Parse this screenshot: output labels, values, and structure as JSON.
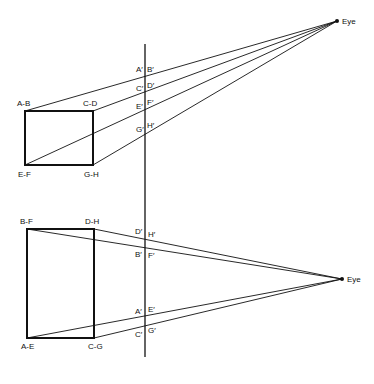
{
  "top_view": {
    "eye_label": "Eye",
    "corner_labels": {
      "tl": "A-B",
      "tr": "C-D",
      "bl": "E-F",
      "br": "G-H"
    },
    "projection_labels": [
      {
        "left": "A′",
        "right": "B′"
      },
      {
        "left": "C′",
        "right": "D′"
      },
      {
        "left": "E′",
        "right": "F′"
      },
      {
        "left": "G′",
        "right": "H′"
      }
    ]
  },
  "side_view": {
    "eye_label": "Eye",
    "corner_labels": {
      "tl": "B-F",
      "tr": "D-H",
      "bl": "A-E",
      "br": "C-G"
    },
    "projection_labels": [
      {
        "left": "D′",
        "right": "H′"
      },
      {
        "left": "B′",
        "right": "F′"
      },
      {
        "left": "A′",
        "right": "E′"
      },
      {
        "left": "C′",
        "right": "G′"
      }
    ]
  }
}
